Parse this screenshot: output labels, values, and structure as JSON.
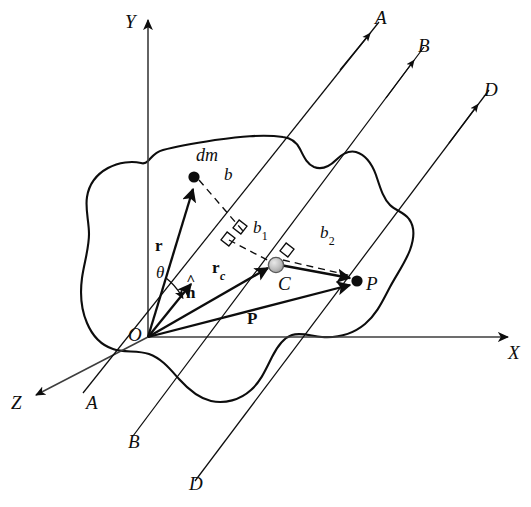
{
  "figure": {
    "background_color": "#ffffff",
    "stroke_color": "#0d0d0d",
    "body_fill": "#ffffff",
    "com_marker_color": "#b0b0b0"
  },
  "axes": {
    "y": {
      "label": "Y",
      "x": 148,
      "y_top": 14,
      "y_bottom": 337
    },
    "x": {
      "label": "X",
      "y": 337,
      "x_left": 148,
      "x_right": 516
    },
    "z": {
      "label": "Z",
      "from": [
        148,
        337
      ],
      "to": [
        30,
        398
      ]
    }
  },
  "origin": {
    "label": "O",
    "x": 148,
    "y": 337
  },
  "parallel_lines": [
    {
      "name": "A",
      "top_label": "A",
      "bottom_label": "A",
      "through": "origin-O",
      "top_point": [
        379,
        22
      ],
      "bottom_point": [
        83,
        393
      ],
      "arrow_at": [
        354,
        70
      ]
    },
    {
      "name": "B",
      "top_label": "B",
      "bottom_label": "B",
      "through": "center-of-mass-C",
      "top_point": [
        424,
        47
      ],
      "bottom_point": [
        133,
        435
      ],
      "arrow_at": [
        398,
        98
      ]
    },
    {
      "name": "D",
      "top_label": "D",
      "bottom_label": "D",
      "through": "point-P",
      "top_point": [
        489,
        90
      ],
      "bottom_point": [
        195,
        480
      ],
      "arrow_at": [
        461,
        142
      ]
    }
  ],
  "points": [
    {
      "id": "dm",
      "label": "dm",
      "x": 194,
      "y": 176,
      "marker": "solid-dot"
    },
    {
      "id": "C",
      "label": "C",
      "x": 274,
      "y": 267,
      "marker": "shaded-circle"
    },
    {
      "id": "P",
      "label": "P",
      "x": 357,
      "y": 280,
      "marker": "solid-dot"
    },
    {
      "id": "O",
      "label": "O",
      "x": 148,
      "y": 337,
      "marker": "vertex"
    }
  ],
  "vectors": [
    {
      "id": "r",
      "label": "r",
      "from": [
        148,
        337
      ],
      "to": [
        192,
        186
      ],
      "style": "solid-arrow"
    },
    {
      "id": "rc",
      "label": "r",
      "sub": "c",
      "from": [
        148,
        337
      ],
      "to": [
        268,
        266
      ],
      "style": "solid-arrow"
    },
    {
      "id": "P",
      "label": "P",
      "from": [
        148,
        337
      ],
      "to": [
        352,
        283
      ],
      "style": "solid-arrow"
    },
    {
      "id": "nhat",
      "label": "n",
      "hat": true,
      "from": [
        148,
        337
      ],
      "to": [
        190,
        283
      ],
      "style": "solid-arrow"
    },
    {
      "id": "CP",
      "label": "",
      "from": [
        279,
        265
      ],
      "to": [
        351,
        278
      ],
      "style": "solid-arrow"
    }
  ],
  "distances": [
    {
      "id": "b",
      "label": "b",
      "sub": "",
      "from": [
        198,
        179
      ],
      "to": [
        240,
        228
      ],
      "style": "dashed",
      "perp_mark": true
    },
    {
      "id": "b1",
      "label": "b",
      "sub": "1",
      "from": [
        228,
        239
      ],
      "to": [
        272,
        261
      ],
      "style": "dashed",
      "perp_mark": true
    },
    {
      "id": "b2",
      "label": "b",
      "sub": "2",
      "from": [
        281,
        259
      ],
      "to": [
        352,
        275
      ],
      "style": "dashed",
      "perp_mark": true
    }
  ],
  "angle": {
    "id": "theta",
    "label": "θ",
    "at": [
      148,
      337
    ],
    "between": [
      "r",
      "nhat"
    ]
  },
  "labels": {
    "Y": "Y",
    "X": "X",
    "Z": "Z",
    "O": "O",
    "A_top": "A",
    "A_bottom": "A",
    "B_top": "B",
    "B_bottom": "B",
    "D_top": "D",
    "D_bottom": "D",
    "dm": "dm",
    "C": "C",
    "P_point": "P",
    "r": "r",
    "rc_base": "r",
    "rc_sub": "c",
    "P_vec": "P",
    "nhat": "n",
    "theta": "θ",
    "b": "b",
    "b1_base": "b",
    "b1_sub": "1",
    "b2_base": "b",
    "b2_sub": "2"
  }
}
